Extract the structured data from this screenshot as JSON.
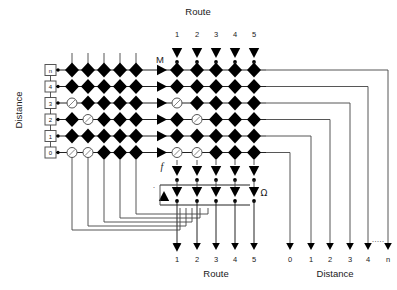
{
  "figure": {
    "kind": "crossbar-routing-diagram",
    "top_axis_title": "Route",
    "bottom_axis_title": "Route",
    "left_axis_title": "Distance",
    "bottom_right_axis_title": "Distance",
    "route_columns": [
      "1",
      "2",
      "3",
      "4",
      "5"
    ],
    "distance_rows": [
      "n",
      "4",
      "3",
      "2",
      "1",
      "0"
    ],
    "distance_outputs": [
      "0",
      "1",
      "2",
      "3",
      "4",
      "n"
    ],
    "distance_output_ellipsis": "·····",
    "label_m": "M",
    "label_f": "f",
    "label_omega": "Ω",
    "label_tick": "·",
    "colors": {
      "ink": "#1a1a1a",
      "wire": "#222222",
      "diamond_fill": "#000000",
      "hollow_fill": "#ffffff",
      "hollow_stroke": "#555555",
      "background": "#ffffff"
    },
    "left_grid": {
      "name": "left-diamond-matrix",
      "columns": 5,
      "rows": 6,
      "hollow_cells": [
        {
          "row": 2,
          "col": 1
        },
        {
          "row": 3,
          "col": 2
        },
        {
          "row": 5,
          "col": 1
        },
        {
          "row": 5,
          "col": 2
        }
      ]
    },
    "right_grid": {
      "name": "right-diamond-matrix",
      "columns": 5,
      "rows": 6,
      "hollow_cells": [
        {
          "row": 2,
          "col": 1
        },
        {
          "row": 3,
          "col": 2
        },
        {
          "row": 5,
          "col": 1
        },
        {
          "row": 5,
          "col": 2
        }
      ]
    },
    "f_stage": {
      "name": "f-threshold-row",
      "count": 5
    },
    "omega_stage": {
      "name": "omega-threshold-row",
      "count": 5
    }
  }
}
